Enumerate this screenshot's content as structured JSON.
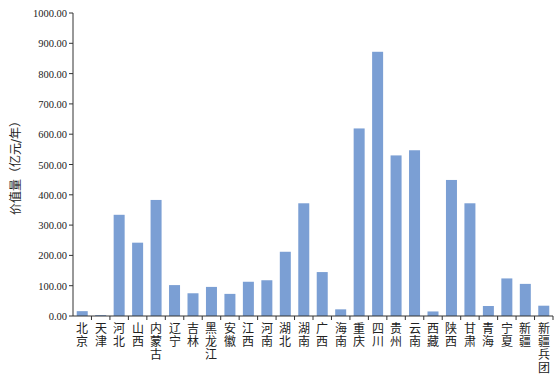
{
  "chart_data": {
    "type": "bar",
    "title": "",
    "xlabel": "",
    "ylabel": "价值量（亿元/年）",
    "ylim": [
      0,
      1000
    ],
    "yticks": [
      "0.00",
      "100.00",
      "200.00",
      "300.00",
      "400.00",
      "500.00",
      "600.00",
      "700.00",
      "800.00",
      "900.00",
      "1000.00"
    ],
    "grid": false,
    "legend": null,
    "bar_color": "#7b9fd4",
    "categories": [
      "北京",
      "天津",
      "河北",
      "山西",
      "内蒙古",
      "辽宁",
      "吉林",
      "黑龙江",
      "安徽",
      "江西",
      "河南",
      "湖北",
      "湖南",
      "广西",
      "海南",
      "重庆",
      "四川",
      "贵州",
      "云南",
      "西藏",
      "陕西",
      "甘肃",
      "青海",
      "宁夏",
      "新疆",
      "新疆兵团"
    ],
    "values": [
      16,
      3,
      334,
      242,
      383,
      102,
      75,
      96,
      73,
      113,
      118,
      212,
      372,
      145,
      22,
      619,
      872,
      530,
      547,
      15,
      449,
      372,
      33,
      124,
      106,
      34
    ]
  }
}
